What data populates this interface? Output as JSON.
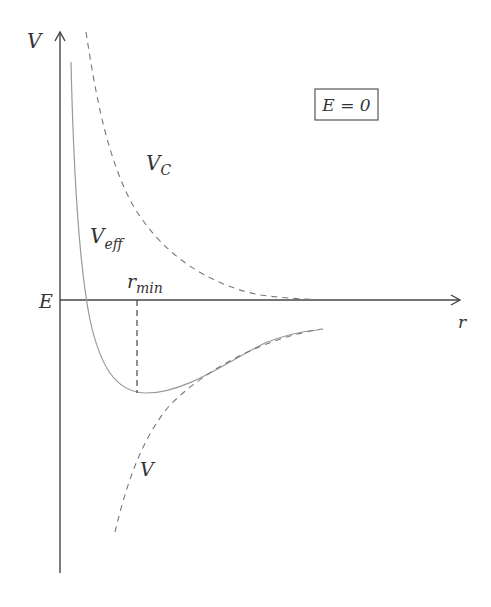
{
  "diagram": {
    "axes": {
      "y_label": "V",
      "x_label": "r",
      "energy_level_label": "E"
    },
    "curves": [
      {
        "name": "V_C",
        "label_main": "V",
        "label_sub": "C",
        "style": "dashed",
        "description": "Centrifugal (repulsive) potential"
      },
      {
        "name": "V_eff",
        "label_main": "V",
        "label_sub": "eff",
        "style": "solid",
        "description": "Effective potential"
      },
      {
        "name": "V",
        "label_main": "V",
        "label_sub": "",
        "style": "dashed",
        "description": "Attractive potential"
      }
    ],
    "marker": {
      "label_main": "r",
      "label_sub": "min",
      "style": "dashed vertical line at minimum of V_eff"
    },
    "box_label": "E = 0",
    "colors": {
      "axis": "#444444",
      "curve_solid": "#999999",
      "curve_dashed": "#777777",
      "text": "#333333"
    }
  }
}
